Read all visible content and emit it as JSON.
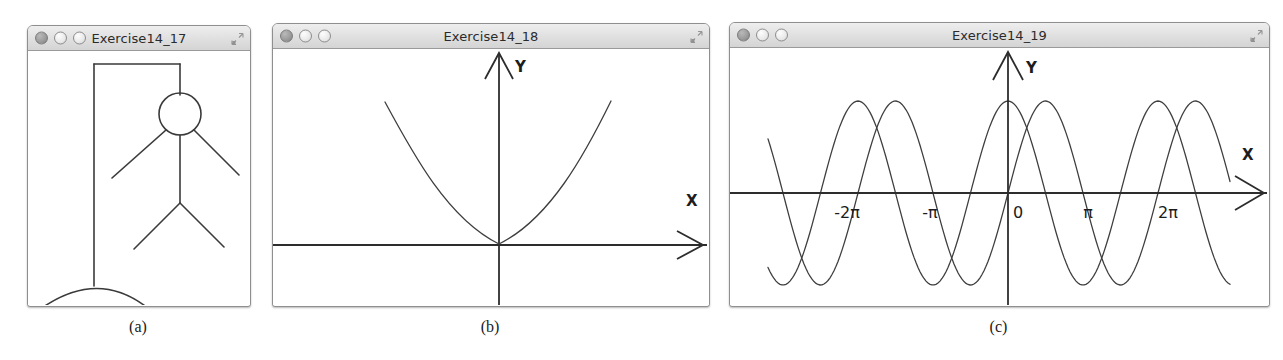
{
  "figure": {
    "windows": [
      {
        "id": "win-a",
        "title": "Exercise14_17",
        "caption": "(a)",
        "content": "hangman-gallows-stick-figure",
        "controls": {
          "close": "close-button",
          "minimize": "minimize-button",
          "zoom": "zoom-button",
          "resize": "resize-grip"
        }
      },
      {
        "id": "win-b",
        "title": "Exercise14_18",
        "caption": "(b)",
        "content": "parabola-plot",
        "controls": {
          "close": "close-button",
          "minimize": "minimize-button",
          "zoom": "zoom-button",
          "resize": "resize-grip"
        }
      },
      {
        "id": "win-c",
        "title": "Exercise14_19",
        "caption": "(c)",
        "content": "sine-cosine-plot",
        "controls": {
          "close": "close-button",
          "minimize": "minimize-button",
          "zoom": "zoom-button",
          "resize": "resize-grip"
        }
      }
    ]
  },
  "chart_data": [
    {
      "id": "parabola",
      "type": "line",
      "title": "",
      "xlabel": "X",
      "ylabel": "Y",
      "axis_labels": [
        "X",
        "Y"
      ],
      "tick_labels": [],
      "grid": false,
      "legend": "none",
      "equation": "y = x^2",
      "vertex": [
        0,
        0
      ],
      "xlim": [
        -1.45,
        1.45
      ],
      "ylim": [
        0,
        2.1
      ],
      "x": [
        -1.4,
        -1.2,
        -1.0,
        -0.8,
        -0.6,
        -0.4,
        -0.2,
        0.0,
        0.2,
        0.4,
        0.6,
        0.8,
        1.0,
        1.2,
        1.4
      ],
      "values": [
        1.96,
        1.44,
        1.0,
        0.64,
        0.36,
        0.16,
        0.04,
        0.0,
        0.04,
        0.16,
        0.36,
        0.64,
        1.0,
        1.44,
        1.96
      ]
    },
    {
      "id": "sine-cosine",
      "type": "line",
      "title": "",
      "xlabel": "X",
      "ylabel": "Y",
      "axis_labels": [
        "X",
        "Y"
      ],
      "tick_labels": [
        "-2π",
        "-π",
        "0",
        "π",
        "2π"
      ],
      "tick_values": [
        -6.2832,
        -3.1416,
        0,
        3.1416,
        6.2832
      ],
      "grid": false,
      "legend": "none",
      "xlim": [
        -9.4,
        9.4
      ],
      "ylim": [
        -1.15,
        1.15
      ],
      "series": [
        {
          "name": "sin(x)",
          "equation": "y = sin(x)",
          "amplitude": 1,
          "period": 6.2832,
          "phase": 0
        },
        {
          "name": "cos(x)",
          "equation": "y = cos(x)",
          "amplitude": 1,
          "period": 6.2832,
          "phase": 1.5708
        }
      ]
    }
  ],
  "drawing": {
    "hangman": {
      "parts": [
        "base-arc",
        "post",
        "beam",
        "rope",
        "head",
        "body",
        "left-arm",
        "right-arm",
        "left-leg",
        "right-leg"
      ]
    }
  }
}
